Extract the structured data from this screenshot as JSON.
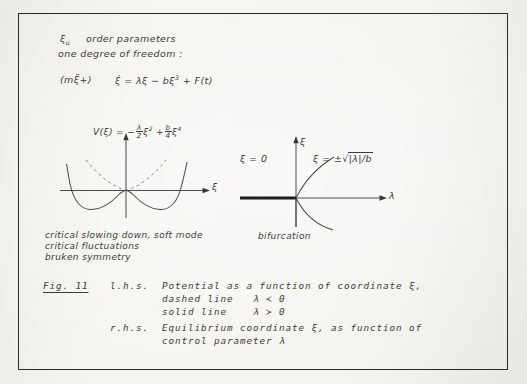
{
  "figure": {
    "border_color": "#2b2b2b",
    "paper_color": "#f2f1ed",
    "ink_color": "#3a3a3c"
  },
  "notes": {
    "line1_symbol": "ξ",
    "line1_sub": "u",
    "line1_text": "order parameters",
    "line2": "one degree of freedom :",
    "equation": {
      "prefix": "(mξ̈+)",
      "lhs": "ξ̇",
      "equals": "=",
      "term1": "λξ",
      "term2": "− bξ",
      "term2_exp": "3",
      "term3": "+ F(t)"
    }
  },
  "left_plot": {
    "formula": {
      "head": "V(ξ) =",
      "sign": "−",
      "frac1_num": "λ",
      "frac1_den": "2",
      "var1": "ξ",
      "var1_exp": "2",
      "plus": "+",
      "frac2_num": "b",
      "frac2_den": "4",
      "var2": "ξ",
      "var2_exp": "4"
    },
    "x_axis_label": "ξ",
    "curve_solid_desc": "double-well potential, lambda greater than zero",
    "curve_dashed_desc": "single-well parabola, lambda less than zero"
  },
  "right_plot": {
    "y_axis_label": "ξ",
    "x_axis_label": "λ",
    "branch_zero_label": "ξ = 0",
    "branch_pm_label_head": "ξ = ±",
    "branch_pm_label_radicand": "|λ|/b",
    "caption": "bifurcation"
  },
  "phenomena": [
    "critical slowing down, soft mode",
    "critical fluctuations",
    "bruken symmetry"
  ],
  "caption": {
    "fig_label": "Fig. 11",
    "lhs_tag": "l.h.s.",
    "lhs_line1": "Potential as a function of coordinate ξ,",
    "lhs_line2": "dashed line   λ ≺ 0",
    "lhs_line3": "solid line    λ ≻ 0",
    "rhs_tag": "r.h.s.",
    "rhs_line1": "Equilibrium coordinate ξ, as function of",
    "rhs_line2": "control parameter λ"
  }
}
